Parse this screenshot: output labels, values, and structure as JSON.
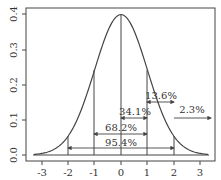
{
  "chart_data": {
    "type": "line",
    "title": "",
    "xlabel": "",
    "ylabel": "",
    "xlim": [
      -3.4,
      3.5
    ],
    "ylim": [
      -0.015,
      0.42
    ],
    "grid": false,
    "x_ticks": [
      "-3",
      "-2",
      "-1",
      "0",
      "1",
      "2",
      "3"
    ],
    "y_ticks": [
      "0.0",
      "0.1",
      "0.2",
      "0.3",
      "0.4"
    ],
    "series": [
      {
        "name": "standard normal density",
        "x": [
          -3.3,
          -3,
          -2.5,
          -2,
          -1.5,
          -1,
          -0.5,
          0,
          0.5,
          1,
          1.5,
          2,
          2.5,
          3,
          3.3
        ],
        "values": [
          0.0017,
          0.0044,
          0.0175,
          0.054,
          0.1295,
          0.242,
          0.352,
          0.399,
          0.352,
          0.242,
          0.1295,
          0.054,
          0.0175,
          0.0044,
          0.0017
        ]
      }
    ],
    "vertical_lines": [
      -2,
      -1,
      0,
      1,
      2
    ],
    "annotations": [
      {
        "text": "95.4%",
        "from": -2,
        "to": 2,
        "y": 0.02
      },
      {
        "text": "68.2%",
        "from": -1,
        "to": 1,
        "y": 0.06
      },
      {
        "text": "34.1%",
        "from": 0,
        "to": 1,
        "y": 0.104
      },
      {
        "text": "13.6%",
        "from": 1,
        "to": 2,
        "y": 0.15
      },
      {
        "text": "2.3%",
        "from": 2,
        "to": 3.4,
        "y": 0.104
      }
    ]
  },
  "labels": {
    "x": [
      "-3",
      "-2",
      "-1",
      "0",
      "1",
      "2",
      "3"
    ],
    "y": [
      "0.0",
      "0.1",
      "0.2",
      "0.3",
      "0.4"
    ],
    "a95": "95.4%",
    "a68": "68.2%",
    "a34": "34.1%",
    "a13": "13.6%",
    "a2": "2.3%"
  }
}
